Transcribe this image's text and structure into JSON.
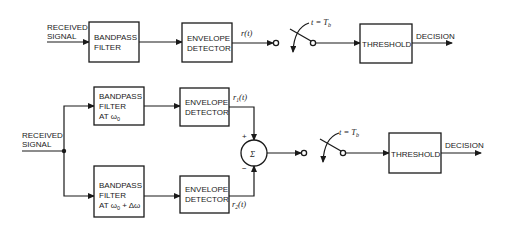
{
  "top_system": {
    "input_label": [
      "RECEIVED",
      "SIGNAL"
    ],
    "bandpass_filter": [
      "BANDPASS",
      "FILTER"
    ],
    "envelope_detector": [
      "ENVELOPE",
      "DETECTOR"
    ],
    "output_signal": "r(t)",
    "switch_label": "t = T",
    "switch_label_sub": "b",
    "threshold": "THRESHOLD",
    "output_label": "DECISION"
  },
  "bottom_system": {
    "input_label": [
      "RECEIVED",
      "SIGNAL"
    ],
    "upper_filter": [
      "BANDPASS",
      "FILTER",
      "AT ω",
      "0",
      ""
    ],
    "lower_filter": [
      "BANDPASS",
      "FILTER",
      "AT ω",
      "0",
      " + Δω"
    ],
    "upper_detector": [
      "ENVELOPE",
      "DETECTOR"
    ],
    "lower_detector": [
      "ENVELOPE",
      "DETECTOR"
    ],
    "r1": "r",
    "r1_sub": "1",
    "r1_arg": "(t)",
    "r2": "r",
    "r2_sub": "2",
    "r2_arg": "(t)",
    "plus": "+",
    "minus": "−",
    "summer": "Σ",
    "switch_label": "t = T",
    "switch_label_sub": "b",
    "threshold": "THRESHOLD",
    "output_label": "DECISION"
  }
}
